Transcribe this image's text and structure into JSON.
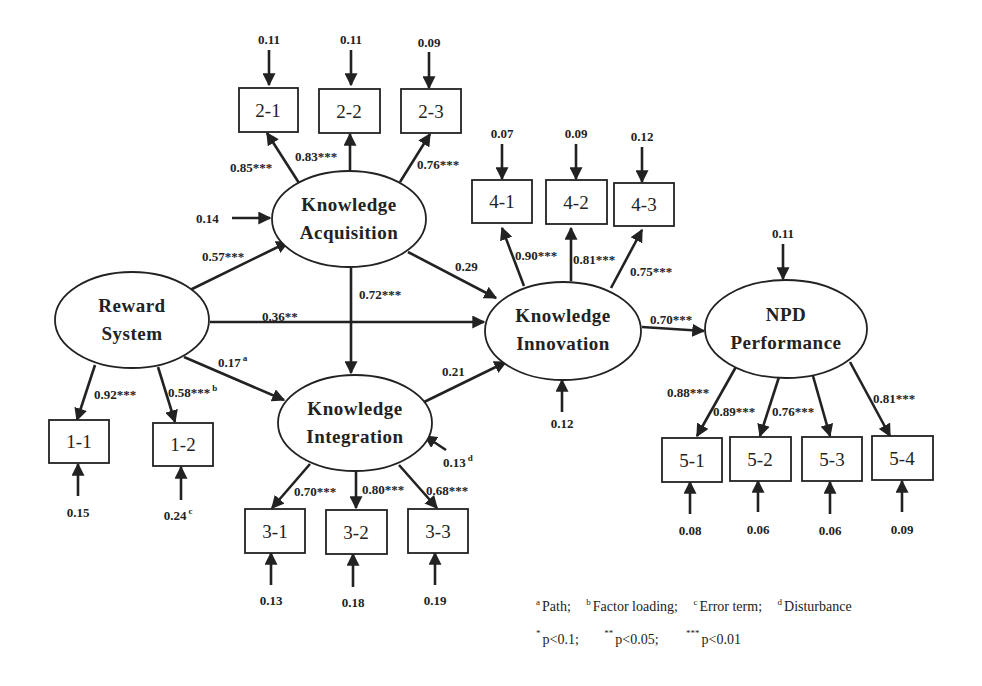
{
  "diagram": {
    "type": "structural-equation-model",
    "latent_constructs": {
      "reward_system": {
        "line1": "Reward",
        "line2": "System"
      },
      "knowledge_acquisition": {
        "line1": "Knowledge",
        "line2": "Acquisition"
      },
      "knowledge_integration": {
        "line1": "Knowledge",
        "line2": "Integration"
      },
      "knowledge_innovation": {
        "line1": "Knowledge",
        "line2": "Innovation"
      },
      "npd_performance": {
        "line1": "NPD",
        "line2": "Performance"
      }
    },
    "indicators": {
      "i1_1": "1-1",
      "i1_2": "1-2",
      "i2_1": "2-1",
      "i2_2": "2-2",
      "i2_3": "2-3",
      "i3_1": "3-1",
      "i3_2": "3-2",
      "i3_3": "3-3",
      "i4_1": "4-1",
      "i4_2": "4-2",
      "i4_3": "4-3",
      "i5_1": "5-1",
      "i5_2": "5-2",
      "i5_3": "5-3",
      "i5_4": "5-4"
    },
    "paths": {
      "rs_ka": "0.57***",
      "rs_ki": "0.17",
      "rs_ki_sup": "a",
      "rs_kinnov": "0.36**",
      "ka_ki": "0.72***",
      "ka_kinnov": "0.29",
      "ki_kinnov": "0.21",
      "kinnov_npd": "0.70***"
    },
    "loadings": {
      "l1_1": "0.92***",
      "l1_2": "0.58***",
      "l1_2_sup": "b",
      "l2_1": "0.85***",
      "l2_2": "0.83***",
      "l2_3": "0.76***",
      "l3_1": "0.70***",
      "l3_2": "0.80***",
      "l3_3": "0.68***",
      "l4_1": "0.90***",
      "l4_2": "0.81***",
      "l4_3": "0.75***",
      "l5_1": "0.88***",
      "l5_2": "0.89***",
      "l5_3": "0.76***",
      "l5_4": "0.81***"
    },
    "error_terms": {
      "e1_1": "0.15",
      "e1_2": "0.24",
      "e1_2_sup": "c",
      "e2_1": "0.11",
      "e2_2": "0.11",
      "e2_3": "0.09",
      "e3_1": "0.13",
      "e3_2": "0.18",
      "e3_3": "0.19",
      "e4_1": "0.07",
      "e4_2": "0.09",
      "e4_3": "0.12",
      "e5_1": "0.08",
      "e5_2": "0.06",
      "e5_3": "0.06",
      "e5_4": "0.09"
    },
    "disturbances": {
      "ka": "0.14",
      "ki": "0.13",
      "ki_sup": "d",
      "kinnov": "0.12",
      "npd": "0.11"
    },
    "legend": {
      "notes": [
        {
          "sup": "a",
          "text": "Path;"
        },
        {
          "sup": "b",
          "text": "Factor loading;"
        },
        {
          "sup": "c",
          "text": "Error term;"
        },
        {
          "sup": "d",
          "text": "Disturbance"
        }
      ],
      "significance": [
        {
          "stars": "*",
          "text": "p<0.1;"
        },
        {
          "stars": "**",
          "text": "p<0.05;"
        },
        {
          "stars": "***",
          "text": "p<0.01"
        }
      ]
    }
  }
}
